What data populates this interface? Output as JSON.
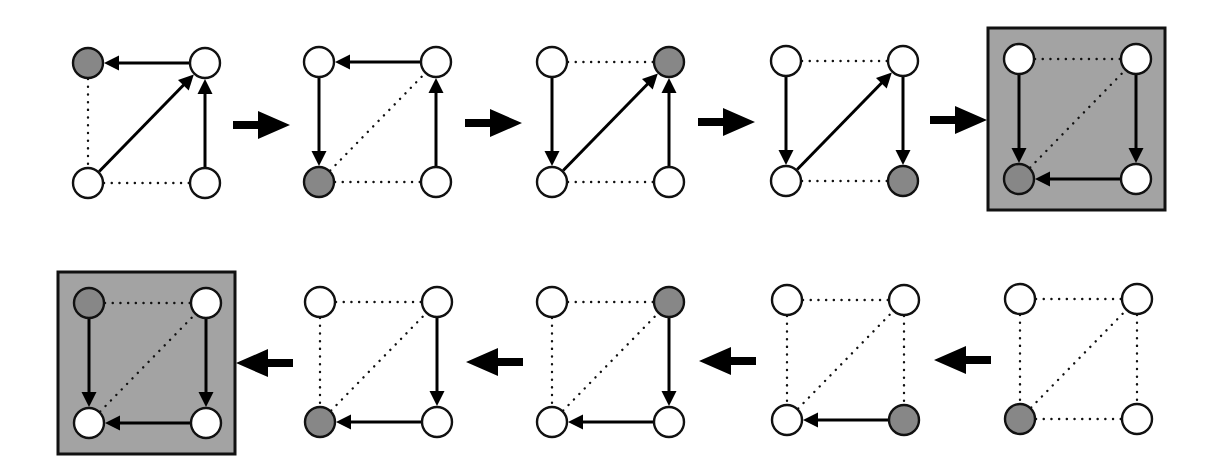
{
  "diagram": {
    "node_radius": 15,
    "colors": {
      "background": "#ffffff",
      "node_fill": "#ffffff",
      "node_highlight_fill": "#878787",
      "stroke": "#111111",
      "box_fill": "#a3a3a3",
      "arrow": "#000000"
    },
    "node_keys": [
      "TL",
      "TR",
      "BL",
      "BR"
    ],
    "panels": [
      {
        "row": "top",
        "column": 1,
        "boxed": false,
        "highlighted_node": "TL",
        "edges": [
          {
            "from": "TR",
            "to": "TL",
            "style": "solid-arrow"
          },
          {
            "from": "BL",
            "to": "TR",
            "style": "solid-arrow"
          },
          {
            "from": "BR",
            "to": "TR",
            "style": "solid-arrow"
          },
          {
            "from": "TL",
            "to": "BL",
            "style": "dotted"
          },
          {
            "from": "BL",
            "to": "BR",
            "style": "dotted"
          }
        ]
      },
      {
        "row": "top",
        "column": 2,
        "boxed": false,
        "highlighted_node": "BL",
        "edges": [
          {
            "from": "TR",
            "to": "TL",
            "style": "solid-arrow"
          },
          {
            "from": "TL",
            "to": "BL",
            "style": "solid-arrow"
          },
          {
            "from": "BR",
            "to": "TR",
            "style": "solid-arrow"
          },
          {
            "from": "BL",
            "to": "TR",
            "style": "dotted"
          },
          {
            "from": "BL",
            "to": "BR",
            "style": "dotted"
          }
        ]
      },
      {
        "row": "top",
        "column": 3,
        "boxed": false,
        "highlighted_node": "TR",
        "edges": [
          {
            "from": "TL",
            "to": "TR",
            "style": "dotted"
          },
          {
            "from": "TL",
            "to": "BL",
            "style": "solid-arrow"
          },
          {
            "from": "BL",
            "to": "TR",
            "style": "solid-arrow"
          },
          {
            "from": "BR",
            "to": "TR",
            "style": "solid-arrow"
          },
          {
            "from": "BL",
            "to": "BR",
            "style": "dotted"
          }
        ]
      },
      {
        "row": "top",
        "column": 4,
        "boxed": false,
        "highlighted_node": "BR",
        "edges": [
          {
            "from": "TL",
            "to": "TR",
            "style": "dotted"
          },
          {
            "from": "TL",
            "to": "BL",
            "style": "solid-arrow"
          },
          {
            "from": "BL",
            "to": "TR",
            "style": "solid-arrow"
          },
          {
            "from": "TR",
            "to": "BR",
            "style": "solid-arrow"
          },
          {
            "from": "BL",
            "to": "BR",
            "style": "dotted"
          }
        ]
      },
      {
        "row": "top",
        "column": 5,
        "boxed": true,
        "highlighted_node": "BL",
        "edges": [
          {
            "from": "TL",
            "to": "TR",
            "style": "dotted"
          },
          {
            "from": "TL",
            "to": "BL",
            "style": "solid-arrow"
          },
          {
            "from": "BL",
            "to": "TR",
            "style": "dotted"
          },
          {
            "from": "TR",
            "to": "BR",
            "style": "solid-arrow"
          },
          {
            "from": "BR",
            "to": "BL",
            "style": "solid-arrow"
          }
        ]
      },
      {
        "row": "bottom",
        "column": 5,
        "boxed": false,
        "highlighted_node": "BL",
        "edges": [
          {
            "from": "TL",
            "to": "TR",
            "style": "dotted"
          },
          {
            "from": "TL",
            "to": "BL",
            "style": "dotted"
          },
          {
            "from": "BL",
            "to": "TR",
            "style": "dotted"
          },
          {
            "from": "TR",
            "to": "BR",
            "style": "dotted"
          },
          {
            "from": "BL",
            "to": "BR",
            "style": "dotted"
          }
        ]
      },
      {
        "row": "bottom",
        "column": 4,
        "boxed": false,
        "highlighted_node": "BR",
        "edges": [
          {
            "from": "TL",
            "to": "TR",
            "style": "dotted"
          },
          {
            "from": "TL",
            "to": "BL",
            "style": "dotted"
          },
          {
            "from": "BL",
            "to": "TR",
            "style": "dotted"
          },
          {
            "from": "TR",
            "to": "BR",
            "style": "dotted"
          },
          {
            "from": "BR",
            "to": "BL",
            "style": "solid-arrow"
          }
        ]
      },
      {
        "row": "bottom",
        "column": 3,
        "boxed": false,
        "highlighted_node": "TR",
        "edges": [
          {
            "from": "TL",
            "to": "TR",
            "style": "dotted"
          },
          {
            "from": "TL",
            "to": "BL",
            "style": "dotted"
          },
          {
            "from": "BL",
            "to": "TR",
            "style": "dotted"
          },
          {
            "from": "TR",
            "to": "BR",
            "style": "solid-arrow"
          },
          {
            "from": "BR",
            "to": "BL",
            "style": "solid-arrow"
          }
        ]
      },
      {
        "row": "bottom",
        "column": 2,
        "boxed": false,
        "highlighted_node": "BL",
        "edges": [
          {
            "from": "TL",
            "to": "TR",
            "style": "dotted"
          },
          {
            "from": "TL",
            "to": "BL",
            "style": "dotted"
          },
          {
            "from": "BL",
            "to": "TR",
            "style": "dotted"
          },
          {
            "from": "TR",
            "to": "BR",
            "style": "solid-arrow"
          },
          {
            "from": "BR",
            "to": "BL",
            "style": "solid-arrow"
          }
        ]
      },
      {
        "row": "bottom",
        "column": 1,
        "boxed": true,
        "highlighted_node": "TL",
        "edges": [
          {
            "from": "TL",
            "to": "TR",
            "style": "dotted"
          },
          {
            "from": "TL",
            "to": "BL",
            "style": "solid-arrow"
          },
          {
            "from": "BL",
            "to": "TR",
            "style": "dotted"
          },
          {
            "from": "TR",
            "to": "BR",
            "style": "solid-arrow"
          },
          {
            "from": "BR",
            "to": "BL",
            "style": "solid-arrow"
          }
        ]
      }
    ],
    "transition_arrows": [
      {
        "row": "top",
        "direction": "right"
      },
      {
        "row": "top",
        "direction": "right"
      },
      {
        "row": "top",
        "direction": "right"
      },
      {
        "row": "top",
        "direction": "right"
      },
      {
        "row": "bottom",
        "direction": "left"
      },
      {
        "row": "bottom",
        "direction": "left"
      },
      {
        "row": "bottom",
        "direction": "left"
      },
      {
        "row": "bottom",
        "direction": "left"
      }
    ]
  }
}
